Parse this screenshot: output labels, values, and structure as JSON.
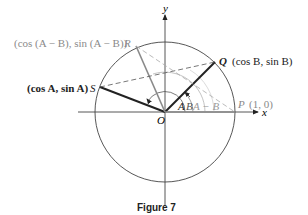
{
  "figure": {
    "caption": "Figure 7",
    "axes": {
      "x_label": "x",
      "y_label": "y",
      "origin_label": "O"
    },
    "points": {
      "P": {
        "name": "P",
        "coords": "(1, 0)"
      },
      "Q": {
        "name": "Q",
        "coords": "(cos B, sin B)"
      },
      "R": {
        "name": "R",
        "coords": "(cos (A − B), sin (A − B))"
      },
      "S": {
        "name": "S",
        "coords": "(cos A, sin A)"
      }
    },
    "angle_labels": {
      "A": "A",
      "B": "B",
      "A_minus_B": "A − B"
    },
    "colors": {
      "dark": "#222222",
      "gray": "#8a8a8a",
      "light_gray": "#b8b8b8"
    }
  }
}
